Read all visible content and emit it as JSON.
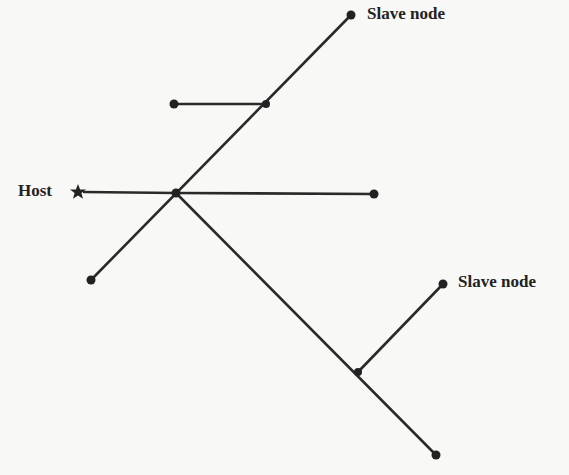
{
  "diagram": {
    "type": "network-topology",
    "labels": {
      "host": "Host",
      "slave_top": "Slave node",
      "slave_right": "Slave node"
    },
    "colors": {
      "line": "#2a2a2a",
      "background": "#f8f8f6"
    },
    "nodes": [
      {
        "id": "host",
        "kind": "host-star",
        "x": 78,
        "y": 192
      },
      {
        "id": "junction-main",
        "kind": "junction",
        "x": 176,
        "y": 193
      },
      {
        "id": "junction-upper",
        "kind": "junction",
        "x": 266,
        "y": 104
      },
      {
        "id": "junction-lower",
        "kind": "junction",
        "x": 358,
        "y": 372
      },
      {
        "id": "slave-top",
        "kind": "endpoint",
        "x": 351,
        "y": 15
      },
      {
        "id": "branch-left",
        "kind": "endpoint",
        "x": 174,
        "y": 104
      },
      {
        "id": "branch-right",
        "kind": "endpoint",
        "x": 374,
        "y": 194
      },
      {
        "id": "branch-bottom-left",
        "kind": "endpoint",
        "x": 91,
        "y": 280
      },
      {
        "id": "slave-right",
        "kind": "endpoint",
        "x": 443,
        "y": 284
      },
      {
        "id": "branch-bottom-right",
        "kind": "endpoint",
        "x": 436,
        "y": 455
      }
    ],
    "edges": [
      [
        "host",
        "junction-main"
      ],
      [
        "junction-main",
        "branch-right"
      ],
      [
        "branch-bottom-left",
        "junction-main"
      ],
      [
        "junction-main",
        "junction-upper"
      ],
      [
        "junction-upper",
        "slave-top"
      ],
      [
        "branch-left",
        "junction-upper"
      ],
      [
        "junction-main",
        "junction-lower"
      ],
      [
        "junction-lower",
        "branch-bottom-right"
      ],
      [
        "junction-lower",
        "slave-right"
      ]
    ]
  }
}
